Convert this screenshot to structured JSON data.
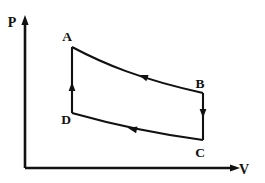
{
  "figure": {
    "kind": "pv-diagram",
    "background_color": "#ffffff",
    "line_color": "#111111",
    "axes": {
      "origin": {
        "x": 25,
        "y": 168
      },
      "vertical": {
        "label": "P",
        "label_name": "pressure-axis-label",
        "label_x": 12,
        "label_y": 27,
        "x": 25,
        "y_top": 15,
        "y_bottom": 168,
        "arrow": "up"
      },
      "horizontal": {
        "label": "V",
        "label_name": "volume-axis-label",
        "label_x": 244,
        "label_y": 174,
        "y": 168,
        "x_left": 25,
        "x_right": 240,
        "arrow": "right"
      }
    },
    "points": [
      {
        "id": "A",
        "label": "A",
        "x": 72,
        "y": 47,
        "label_x": 67,
        "label_y": 41
      },
      {
        "id": "B",
        "label": "B",
        "x": 203,
        "y": 93,
        "label_x": 200,
        "label_y": 88
      },
      {
        "id": "C",
        "label": "C",
        "x": 203,
        "y": 140,
        "label_x": 200,
        "label_y": 157
      },
      {
        "id": "D",
        "label": "D",
        "x": 72,
        "y": 113,
        "label_x": 66,
        "label_y": 124
      }
    ],
    "processes": [
      {
        "id": "AB",
        "from": "A",
        "to": "B",
        "shape": "curve",
        "kind": "isotherm-expansion",
        "path": "M 72 47 C 104 64, 140 79, 203 93",
        "arrow_x": 139,
        "arrow_y": 75,
        "arrow_angle": 200
      },
      {
        "id": "BC",
        "from": "B",
        "to": "C",
        "shape": "line",
        "kind": "isochoric-cooling",
        "path": "M 203 93 L 203 140",
        "arrow_x": 203,
        "arrow_y": 118,
        "arrow_angle": 90
      },
      {
        "id": "DC",
        "from": "C",
        "to": "D",
        "shape": "curve",
        "kind": "isotherm-compression",
        "path": "M 72 113 C 104 122, 150 133, 203 140",
        "arrow_x": 128,
        "arrow_y": 128,
        "arrow_angle": 192
      },
      {
        "id": "DA",
        "from": "D",
        "to": "A",
        "shape": "line",
        "kind": "isochoric-heating",
        "path": "M 72 113 L 72 47",
        "arrow_x": 72,
        "arrow_y": 82,
        "arrow_angle": 270
      }
    ]
  }
}
